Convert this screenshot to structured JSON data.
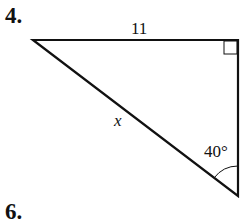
{
  "problems": {
    "current_number": "4.",
    "next_number": "6."
  },
  "diagram": {
    "type": "right triangle",
    "side_top_label": "11",
    "hypotenuse_label": "x",
    "angle_label": "40°",
    "right_angle_marker": "top-right vertex",
    "stroke_color": "#111111"
  }
}
